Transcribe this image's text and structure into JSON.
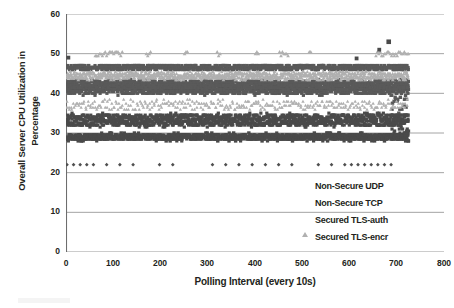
{
  "chart_data": {
    "type": "scatter",
    "title": "",
    "xlabel": "Polling Interval (every 10s)",
    "ylabel_line1": "Overall Server CPU Utilization in",
    "ylabel_line2": "Percentage",
    "xlim": [
      0,
      800
    ],
    "ylim": [
      0,
      60
    ],
    "xticks": [
      0,
      100,
      200,
      300,
      400,
      500,
      600,
      700,
      800
    ],
    "yticks": [
      0,
      10,
      20,
      30,
      40,
      50,
      60
    ],
    "grid": "horizontal",
    "legend_position": "inside-bottom-right",
    "series": [
      {
        "name": "Non-Secure UDP",
        "marker": "diamond",
        "color": "#4f4f4f",
        "description": "Sparse band near 22% across the full polling range, plus a dense cluster 0-60 and 600-690",
        "band_center": 22,
        "x_range": [
          0,
          725
        ]
      },
      {
        "name": "Non-Secure TCP",
        "marker": "square",
        "color": "#4a4a4a",
        "description": "Dense bands at 28-30% and 33-35%, scattered squares near 22% and a high outlier near 53% at x=680",
        "band_center": 29,
        "x_range": [
          0,
          725
        ]
      },
      {
        "name": "Secured TLS-auth",
        "marker": "triangle",
        "color": "#b0b0b0",
        "description": "Light gray triangles forming a band at 44-45% and clusters at 50% and 36-38%",
        "band_center": 44.5,
        "x_range": [
          0,
          725
        ]
      },
      {
        "name": "Secured TLS-encr",
        "marker": "square",
        "color": "#5a5a5a",
        "description": "Dark squares forming a dense band at 40-47% across the full range",
        "band_center": 43,
        "x_range": [
          0,
          725
        ]
      }
    ],
    "bands": [
      {
        "series": "Secured TLS-auth",
        "y": 50,
        "spread": 0.6,
        "density": "sparse-clusters"
      },
      {
        "series": "Secured TLS-encr",
        "y": 46.5,
        "spread": 0.5,
        "density": "dense"
      },
      {
        "series": "Secured TLS-auth",
        "y": 44.5,
        "spread": 0.8,
        "density": "dense"
      },
      {
        "series": "Secured TLS-encr",
        "y": 42,
        "spread": 1.2,
        "density": "very-dense"
      },
      {
        "series": "Secured TLS-encr",
        "y": 40.5,
        "spread": 0.8,
        "density": "dense"
      },
      {
        "series": "Secured TLS-auth",
        "y": 37,
        "spread": 1.0,
        "density": "medium"
      },
      {
        "series": "Non-Secure TCP",
        "y": 34,
        "spread": 0.8,
        "density": "dense"
      },
      {
        "series": "Non-Secure TCP",
        "y": 32.5,
        "spread": 0.8,
        "density": "dense"
      },
      {
        "series": "Non-Secure TCP",
        "y": 29,
        "spread": 0.8,
        "density": "very-dense"
      },
      {
        "series": "Non-Secure UDP",
        "y": 22,
        "spread": 0.2,
        "density": "sparse"
      }
    ],
    "outliers": [
      {
        "series": "Non-Secure TCP",
        "x": 5,
        "y": 49
      },
      {
        "series": "Non-Secure TCP",
        "x": 615,
        "y": 48.8
      },
      {
        "series": "Non-Secure TCP",
        "x": 683,
        "y": 53
      },
      {
        "series": "Non-Secure TCP",
        "x": 663,
        "y": 51
      }
    ]
  },
  "axes": {
    "y_tick_labels": [
      "60",
      "50",
      "40",
      "30",
      "20",
      "10",
      "0"
    ],
    "x_tick_labels": [
      "0",
      "100",
      "200",
      "300",
      "400",
      "500",
      "600",
      "700",
      "800"
    ],
    "y_title_line1": "Overall Server CPU Utilization in",
    "y_title_line2": "Percentage",
    "x_title": "Polling Interval (every 10s)"
  },
  "legend": {
    "items": [
      {
        "label": "Non-Secure UDP",
        "marker": "diamond",
        "color": "#4f4f4f"
      },
      {
        "label": "Non-Secure TCP",
        "marker": "square",
        "color": "#4a4a4a"
      },
      {
        "label": "Secured TLS-auth",
        "marker": "triangle",
        "color": "#b0b0b0"
      },
      {
        "label": "Secured TLS-encr",
        "marker": "square",
        "color": "#5a5a5a"
      }
    ]
  },
  "colors": {
    "grid": "#9a9a9a",
    "axis": "#6d6d6d",
    "text": "#231f20",
    "udp": "#4f4f4f",
    "tcp": "#4a4a4a",
    "tls_auth": "#b0b0b0",
    "tls_encr": "#5a5a5a"
  }
}
